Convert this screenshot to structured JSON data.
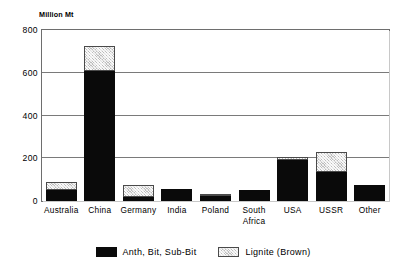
{
  "chart_data": {
    "type": "bar",
    "subtype": "stacked-vertical-bar",
    "title": "",
    "xlabel": "",
    "ylabel": "Million Mt",
    "ylim": [
      0,
      800
    ],
    "yticks": [
      0,
      200,
      400,
      600,
      800
    ],
    "ytick_labels": [
      "0",
      "200",
      "400",
      "600",
      "800"
    ],
    "grid": true,
    "grid_axis": "y",
    "legend_position": "bottom-center",
    "categories": [
      "Australia",
      "China",
      "Germany",
      "India",
      "Poland",
      "South\nAfrica",
      "USA",
      "USSR",
      "Other"
    ],
    "series": [
      {
        "name": "Anth, Bit, Sub-Bit",
        "color": "#0a0a0a",
        "pattern": "solid",
        "values": [
          50,
          607,
          18,
          57,
          25,
          50,
          192,
          135,
          73
        ]
      },
      {
        "name": "Lignite (Brown)",
        "color": "#bdbdbd",
        "pattern": "hatched",
        "values": [
          40,
          120,
          57,
          0,
          8,
          0,
          15,
          95,
          0
        ]
      }
    ],
    "totals": [
      90,
      727,
      75,
      57,
      33,
      50,
      207,
      230,
      73
    ]
  },
  "legend": {
    "items": [
      {
        "label": "Anth, Bit, Sub-Bit",
        "swatch": "dark"
      },
      {
        "label": "Lignite (Brown)",
        "swatch": "light"
      }
    ]
  }
}
